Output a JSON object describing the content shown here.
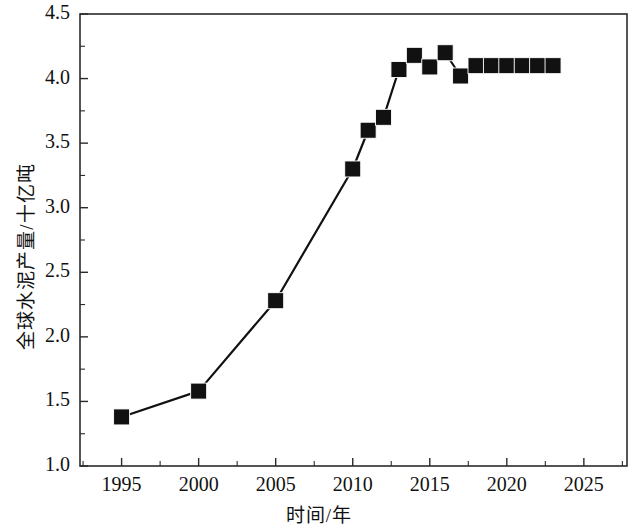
{
  "figure": {
    "kind": "line-chart",
    "background_color": "#ffffff",
    "ink_color": "#1a1a1a"
  },
  "axes": {
    "x_title": "时间/年",
    "y_title": "全球水泥产量/十亿吨",
    "x_ticks": [
      "1995",
      "2000",
      "2005",
      "2010",
      "2015",
      "2020",
      "2025"
    ],
    "y_ticks": [
      "1.0",
      "1.5",
      "2.0",
      "2.5",
      "3.0",
      "3.5",
      "4.0",
      "4.5"
    ]
  },
  "chart_data": {
    "type": "line",
    "title": "",
    "subtitle": "",
    "xlabel": "时间/年",
    "ylabel": "全球水泥产量/十亿吨",
    "xlim": [
      1992.3,
      2027.8
    ],
    "ylim": [
      1.0,
      4.5
    ],
    "xticks": [
      1995,
      2000,
      2005,
      2010,
      2015,
      2020,
      2025
    ],
    "yticks": [
      1.0,
      1.5,
      2.0,
      2.5,
      3.0,
      3.5,
      4.0,
      4.5
    ],
    "x_minor_tick_step": 2.5,
    "y_minor_tick_step": 0.25,
    "grid": false,
    "legend": null,
    "marker": "square",
    "marker_color": "#111111",
    "line_color": "#111111",
    "series": [
      {
        "name": "全球水泥产量",
        "x": [
          1995,
          2000,
          2005,
          2010,
          2011,
          2012,
          2013,
          2014,
          2015,
          2016,
          2017,
          2018,
          2019,
          2020,
          2021,
          2022,
          2023
        ],
        "values": [
          1.38,
          1.58,
          2.28,
          3.3,
          3.6,
          3.7,
          4.07,
          4.18,
          4.09,
          4.2,
          4.02,
          4.1,
          4.1,
          4.1,
          4.1,
          4.1,
          4.1
        ]
      }
    ]
  }
}
